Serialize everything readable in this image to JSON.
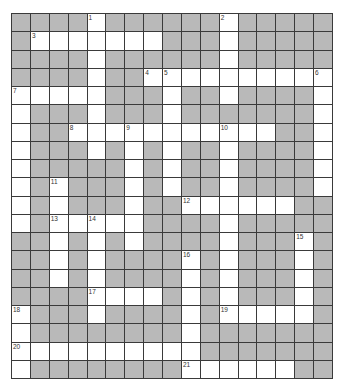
{
  "puzzle": {
    "type": "crossword",
    "cols": 17,
    "rows": 20,
    "colors": {
      "block": "#b9b9b9",
      "open": "#ffffff",
      "line": "#3a3a3a"
    },
    "open_cells": [
      [
        4,
        11
      ],
      [
        1,
        2,
        3,
        4,
        5,
        6,
        7,
        11
      ],
      [
        4,
        11
      ],
      [
        4,
        7,
        8,
        9,
        10,
        11,
        12,
        13,
        14,
        15,
        16
      ],
      [
        0,
        1,
        2,
        3,
        4,
        8,
        11,
        16
      ],
      [
        0,
        4,
        8,
        16
      ],
      [
        0,
        3,
        4,
        5,
        6,
        7,
        8,
        9,
        10,
        11,
        12,
        13,
        16
      ],
      [
        0,
        4,
        6,
        8,
        11,
        16
      ],
      [
        0,
        6,
        8,
        11,
        16
      ],
      [
        0,
        2,
        6,
        8,
        11,
        16
      ],
      [
        0,
        2,
        6,
        9,
        10,
        11,
        12,
        13,
        14
      ],
      [
        0,
        2,
        3,
        4,
        5,
        6,
        11
      ],
      [
        2,
        4,
        6,
        11,
        15
      ],
      [
        2,
        4,
        9,
        11,
        15
      ],
      [
        2,
        4,
        9,
        11,
        15
      ],
      [
        4,
        5,
        6,
        7,
        9,
        11,
        15
      ],
      [
        0,
        4,
        9,
        11,
        12,
        13,
        14,
        15
      ],
      [
        0,
        9
      ],
      [
        0,
        1,
        2,
        3,
        4,
        5,
        6,
        7,
        8,
        9
      ],
      [
        0,
        9,
        10,
        11,
        12,
        13,
        14
      ]
    ],
    "numbers": [
      {
        "row": 0,
        "col": 4,
        "n": "1"
      },
      {
        "row": 0,
        "col": 11,
        "n": "2"
      },
      {
        "row": 1,
        "col": 1,
        "n": "3"
      },
      {
        "row": 3,
        "col": 7,
        "n": "4"
      },
      {
        "row": 3,
        "col": 8,
        "n": "5"
      },
      {
        "row": 3,
        "col": 16,
        "n": "6"
      },
      {
        "row": 4,
        "col": 0,
        "n": "7"
      },
      {
        "row": 6,
        "col": 3,
        "n": "8"
      },
      {
        "row": 6,
        "col": 6,
        "n": "9"
      },
      {
        "row": 6,
        "col": 11,
        "n": "10"
      },
      {
        "row": 9,
        "col": 2,
        "n": "11"
      },
      {
        "row": 10,
        "col": 9,
        "n": "12"
      },
      {
        "row": 11,
        "col": 2,
        "n": "13"
      },
      {
        "row": 11,
        "col": 4,
        "n": "14"
      },
      {
        "row": 12,
        "col": 15,
        "n": "15"
      },
      {
        "row": 13,
        "col": 9,
        "n": "16"
      },
      {
        "row": 15,
        "col": 4,
        "n": "17"
      },
      {
        "row": 16,
        "col": 0,
        "n": "18"
      },
      {
        "row": 16,
        "col": 11,
        "n": "19"
      },
      {
        "row": 18,
        "col": 0,
        "n": "20"
      },
      {
        "row": 19,
        "col": 9,
        "n": "21"
      }
    ]
  }
}
